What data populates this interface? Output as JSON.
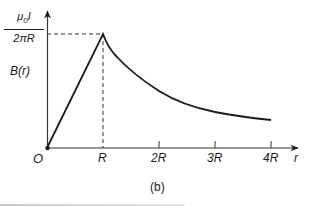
{
  "chart_data": {
    "type": "line",
    "title": "",
    "caption": "(b)",
    "xlabel": "r",
    "ylabel": "B(r)",
    "x_ticks": [
      "O",
      "R",
      "2R",
      "3R",
      "4R"
    ],
    "x_tick_values": [
      0,
      1,
      2,
      3,
      4
    ],
    "y_tick_labels": [
      {
        "value": 1,
        "label": "μ0 I / 2πR"
      }
    ],
    "peak": {
      "x": 1,
      "y": 1,
      "label_numerator": "μ0I",
      "label_denominator": "2πR"
    },
    "series": [
      {
        "name": "B(r)",
        "x": [
          0,
          1,
          1.25,
          1.5,
          1.75,
          2,
          2.5,
          3,
          3.5,
          4
        ],
        "values": [
          0,
          1,
          0.8,
          0.667,
          0.571,
          0.5,
          0.4,
          0.333,
          0.286,
          0.25
        ],
        "description": "Linear rise inside r<R (B ∝ r), 1/r decay for r>R"
      }
    ],
    "guides": [
      {
        "type": "dashed-horizontal",
        "y": 1,
        "from_x": 0,
        "to_x": 1
      },
      {
        "type": "dashed-vertical",
        "x": 1,
        "from_y": 0,
        "to_y": 1
      }
    ],
    "xlim": [
      0,
      4.4
    ],
    "ylim": [
      0,
      1.2
    ],
    "grid": false,
    "legend": null
  },
  "labels": {
    "y_numerator": "μ0I",
    "y_denominator": "2πR",
    "y_axis": "B(r)",
    "origin": "O",
    "tick_R": "R",
    "tick_2R": "2R",
    "tick_3R": "3R",
    "tick_4R": "4R",
    "x_axis": "r",
    "caption": "(b)"
  }
}
